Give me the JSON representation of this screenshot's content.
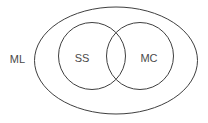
{
  "diagram": {
    "type": "venn",
    "colors": {
      "stroke": "#3f3f3f",
      "text": "#4a4a4a",
      "background": "#ffffff"
    },
    "outer_set": {
      "label": "ML",
      "shape": "ellipse"
    },
    "inner_sets": [
      {
        "label": "SS",
        "shape": "circle"
      },
      {
        "label": "MC",
        "shape": "circle"
      }
    ],
    "relationships": [
      {
        "type": "subset",
        "child": "SS",
        "parent": "ML"
      },
      {
        "type": "subset",
        "child": "MC",
        "parent": "ML"
      },
      {
        "type": "overlap",
        "a": "SS",
        "b": "MC"
      }
    ]
  }
}
